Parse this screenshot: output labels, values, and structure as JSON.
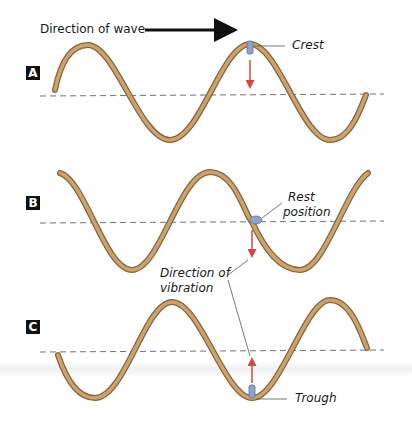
{
  "title_arrow": {
    "label": "Direction of wave"
  },
  "panels": [
    {
      "id": "A",
      "label": "A",
      "callout": "Crest"
    },
    {
      "id": "B",
      "label": "B",
      "callout_line1": "Rest",
      "callout_line2": "position",
      "shared_callout_line1": "Direction of",
      "shared_callout_line2": "vibration"
    },
    {
      "id": "C",
      "label": "C",
      "callout": "Trough"
    }
  ],
  "colors": {
    "rope": "#b08552",
    "rope_highlight": "#d8b88a",
    "baseline": "#6b7480",
    "vibration_arrow": "#d9453c",
    "label_bg": "#111111"
  }
}
